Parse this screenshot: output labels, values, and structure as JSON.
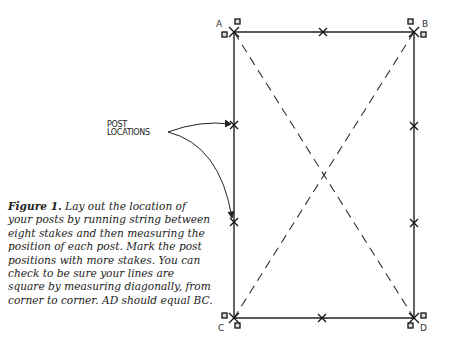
{
  "diagram": {
    "corner_labels": {
      "a": "A",
      "b": "B",
      "c": "C",
      "d": "D"
    },
    "callout": {
      "line1": "POST",
      "line2": "LOCATIONS"
    }
  },
  "caption": {
    "figure_label": "Figure 1.",
    "text": " Lay out the location of your posts by running string between eight stakes and then measuring the position of each post. Mark the post positions with more stakes. You can check to be sure your lines are square by measuring diagonally, from corner to corner. AD should equal BC."
  }
}
